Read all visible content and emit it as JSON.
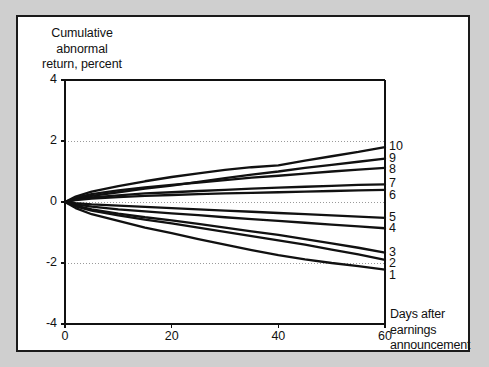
{
  "figure": {
    "background_color": "#cfcfcf",
    "panel_color": "#ffffff",
    "border_color": "#1a1a1a",
    "line_color": "#111111",
    "grid_color": "#9a9a9a"
  },
  "chart_data": {
    "type": "line",
    "title": "",
    "ylabel_lines": [
      "Cumulative",
      "abnormal",
      "return, percent"
    ],
    "xlabel_lines": [
      "Days after",
      "earnings",
      "announcement"
    ],
    "xlabel": "Days after earnings announcement",
    "ylabel": "Cumulative abnormal return, percent",
    "xlim": [
      0,
      60
    ],
    "ylim": [
      -4,
      4
    ],
    "xticks": [
      0,
      20,
      40,
      60
    ],
    "xtick_labels": [
      "0",
      "20",
      "40",
      "60"
    ],
    "yticks": [
      4,
      2,
      0,
      -2,
      -4
    ],
    "ytick_labels": [
      "4",
      "2",
      "0",
      "-2",
      "-4"
    ],
    "gridlines_y": [
      2,
      0,
      -2
    ],
    "grid": "horizontal-dotted",
    "legend_position": "right-end-of-line",
    "x": [
      0,
      2,
      5,
      10,
      15,
      20,
      25,
      30,
      35,
      40,
      45,
      50,
      55,
      60
    ],
    "series": [
      {
        "name": "10",
        "label": "10",
        "values": [
          0.0,
          0.18,
          0.34,
          0.52,
          0.68,
          0.82,
          0.94,
          1.05,
          1.14,
          1.2,
          1.36,
          1.5,
          1.64,
          1.8
        ]
      },
      {
        "name": "9",
        "label": "9",
        "values": [
          0.0,
          0.1,
          0.2,
          0.32,
          0.44,
          0.54,
          0.66,
          0.78,
          0.9,
          1.0,
          1.12,
          1.22,
          1.32,
          1.42
        ]
      },
      {
        "name": "8",
        "label": "8",
        "values": [
          0.0,
          0.14,
          0.26,
          0.38,
          0.48,
          0.56,
          0.64,
          0.72,
          0.8,
          0.86,
          0.93,
          1.0,
          1.06,
          1.12
        ]
      },
      {
        "name": "7",
        "label": "7",
        "values": [
          0.0,
          0.08,
          0.15,
          0.22,
          0.28,
          0.32,
          0.36,
          0.4,
          0.44,
          0.47,
          0.5,
          0.53,
          0.56,
          0.58
        ]
      },
      {
        "name": "6",
        "label": "6",
        "values": [
          0.0,
          0.06,
          0.11,
          0.16,
          0.2,
          0.23,
          0.26,
          0.28,
          0.3,
          0.32,
          0.34,
          0.36,
          0.38,
          0.4
        ]
      },
      {
        "name": "5",
        "label": "5",
        "values": [
          0.0,
          -0.04,
          -0.08,
          -0.12,
          -0.16,
          -0.2,
          -0.24,
          -0.28,
          -0.32,
          -0.36,
          -0.4,
          -0.44,
          -0.48,
          -0.52
        ]
      },
      {
        "name": "4",
        "label": "4",
        "values": [
          0.0,
          -0.08,
          -0.15,
          -0.24,
          -0.31,
          -0.37,
          -0.43,
          -0.5,
          -0.56,
          -0.62,
          -0.68,
          -0.74,
          -0.8,
          -0.86
        ]
      },
      {
        "name": "3",
        "label": "3",
        "values": [
          0.0,
          -0.12,
          -0.24,
          -0.38,
          -0.5,
          -0.6,
          -0.72,
          -0.84,
          -0.96,
          -1.08,
          -1.22,
          -1.36,
          -1.5,
          -1.66
        ]
      },
      {
        "name": "2",
        "label": "2",
        "values": [
          0.0,
          -0.14,
          -0.28,
          -0.44,
          -0.58,
          -0.7,
          -0.84,
          -0.98,
          -1.12,
          -1.26,
          -1.4,
          -1.56,
          -1.72,
          -1.9
        ]
      },
      {
        "name": "1",
        "label": "1",
        "values": [
          0.0,
          -0.2,
          -0.4,
          -0.62,
          -0.84,
          -1.02,
          -1.22,
          -1.4,
          -1.58,
          -1.74,
          -1.88,
          -2.0,
          -2.1,
          -2.22
        ]
      }
    ]
  }
}
